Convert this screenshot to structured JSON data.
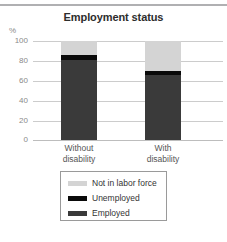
{
  "chart_data": {
    "type": "bar",
    "subtype": "stacked-bar",
    "title": "Employment status",
    "xlabel": "",
    "ylabel": "%",
    "ylim": [
      0,
      100
    ],
    "yticks": [
      0,
      20,
      40,
      60,
      80,
      100
    ],
    "ytick_labels": [
      "0",
      "20",
      "40",
      "60",
      "80",
      "100"
    ],
    "grid": true,
    "legend_position": "bottom",
    "categories": [
      "Without disability",
      "With disability"
    ],
    "category_lines": [
      [
        "Without",
        "disability"
      ],
      [
        "With",
        "disability"
      ]
    ],
    "series": [
      {
        "name": "Employed",
        "values": [
          81,
          66
        ],
        "color": "#3a3a3a"
      },
      {
        "name": "Unemployed",
        "values": [
          5,
          4
        ],
        "color": "#0a0a0a"
      },
      {
        "name": "Not in labor force",
        "values": [
          14,
          30
        ],
        "color": "#d4d4d4"
      }
    ]
  },
  "legend": {
    "entries": [
      {
        "label": "Not in labor force",
        "color": "#d4d4d4"
      },
      {
        "label": "Unemployed",
        "color": "#0a0a0a"
      },
      {
        "label": "Employed",
        "color": "#3a3a3a"
      }
    ]
  },
  "axis": {
    "unit_label": "%",
    "gridline_color": "#cccccc"
  }
}
